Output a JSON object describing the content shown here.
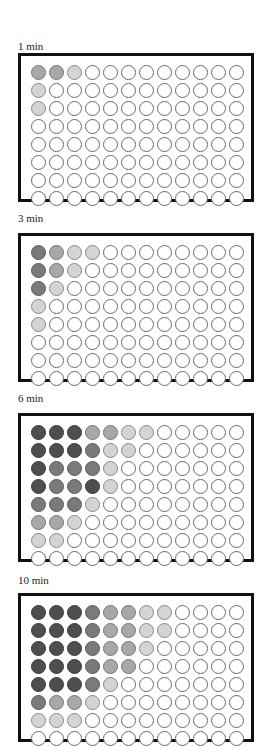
{
  "figure": {
    "legend_levels": {
      "0": "empty",
      "1": "light",
      "2": "medium",
      "3": "medium-dark",
      "4": "dark"
    },
    "colors": {
      "empty": "#ffffff",
      "light": "#d4d4d4",
      "medium": "#a8a8a8",
      "medium-dark": "#7a7a7a",
      "dark": "#4e4e4e",
      "border": "#111111"
    },
    "plate_format": {
      "rows": 8,
      "columns": 12
    }
  },
  "panels": [
    {
      "label": "1 min",
      "wells": [
        [
          2,
          2,
          1,
          0,
          0,
          0,
          0,
          0,
          0,
          0,
          0,
          0
        ],
        [
          1,
          0,
          0,
          0,
          0,
          0,
          0,
          0,
          0,
          0,
          0,
          0
        ],
        [
          1,
          0,
          0,
          0,
          0,
          0,
          0,
          0,
          0,
          0,
          0,
          0
        ],
        [
          0,
          0,
          0,
          0,
          0,
          0,
          0,
          0,
          0,
          0,
          0,
          0
        ],
        [
          0,
          0,
          0,
          0,
          0,
          0,
          0,
          0,
          0,
          0,
          0,
          0
        ],
        [
          0,
          0,
          0,
          0,
          0,
          0,
          0,
          0,
          0,
          0,
          0,
          0
        ],
        [
          0,
          0,
          0,
          0,
          0,
          0,
          0,
          0,
          0,
          0,
          0,
          0
        ],
        [
          0,
          0,
          0,
          0,
          0,
          0,
          0,
          0,
          0,
          0,
          0,
          0
        ]
      ]
    },
    {
      "label": "3 min",
      "wells": [
        [
          3,
          2,
          1,
          1,
          0,
          0,
          0,
          0,
          0,
          0,
          0,
          0
        ],
        [
          3,
          2,
          1,
          0,
          0,
          0,
          0,
          0,
          0,
          0,
          0,
          0
        ],
        [
          3,
          1,
          0,
          0,
          0,
          0,
          0,
          0,
          0,
          0,
          0,
          0
        ],
        [
          1,
          0,
          0,
          0,
          0,
          0,
          0,
          0,
          0,
          0,
          0,
          0
        ],
        [
          1,
          0,
          0,
          0,
          0,
          0,
          0,
          0,
          0,
          0,
          0,
          0
        ],
        [
          0,
          0,
          0,
          0,
          0,
          0,
          0,
          0,
          0,
          0,
          0,
          0
        ],
        [
          0,
          0,
          0,
          0,
          0,
          0,
          0,
          0,
          0,
          0,
          0,
          0
        ],
        [
          0,
          0,
          0,
          0,
          0,
          0,
          0,
          0,
          0,
          0,
          0,
          0
        ]
      ]
    },
    {
      "label": "6 min",
      "wells": [
        [
          4,
          4,
          4,
          2,
          2,
          1,
          1,
          0,
          0,
          0,
          0,
          0
        ],
        [
          4,
          4,
          4,
          3,
          1,
          1,
          0,
          0,
          0,
          0,
          0,
          0
        ],
        [
          4,
          3,
          3,
          3,
          1,
          0,
          0,
          0,
          0,
          0,
          0,
          0
        ],
        [
          4,
          3,
          3,
          4,
          1,
          0,
          0,
          0,
          0,
          0,
          0,
          0
        ],
        [
          3,
          3,
          3,
          1,
          0,
          0,
          0,
          0,
          0,
          0,
          0,
          0
        ],
        [
          2,
          2,
          1,
          0,
          0,
          0,
          0,
          0,
          0,
          0,
          0,
          0
        ],
        [
          1,
          1,
          0,
          0,
          0,
          0,
          0,
          0,
          0,
          0,
          0,
          0
        ],
        [
          0,
          0,
          0,
          0,
          0,
          0,
          0,
          0,
          0,
          0,
          0,
          0
        ]
      ]
    },
    {
      "label": "10 min",
      "wells": [
        [
          4,
          4,
          4,
          3,
          2,
          2,
          1,
          1,
          0,
          0,
          0,
          0
        ],
        [
          4,
          4,
          4,
          3,
          2,
          2,
          1,
          1,
          0,
          0,
          0,
          0
        ],
        [
          4,
          4,
          4,
          3,
          2,
          2,
          1,
          0,
          0,
          0,
          0,
          0
        ],
        [
          4,
          4,
          4,
          3,
          2,
          2,
          0,
          0,
          0,
          0,
          0,
          0
        ],
        [
          4,
          4,
          4,
          3,
          1,
          0,
          0,
          0,
          0,
          0,
          0,
          0
        ],
        [
          3,
          2,
          2,
          1,
          0,
          0,
          0,
          0,
          0,
          0,
          0,
          0
        ],
        [
          1,
          1,
          1,
          0,
          0,
          0,
          0,
          0,
          0,
          0,
          0,
          0
        ],
        [
          0,
          0,
          0,
          0,
          0,
          0,
          0,
          0,
          0,
          0,
          0,
          0
        ]
      ]
    }
  ]
}
